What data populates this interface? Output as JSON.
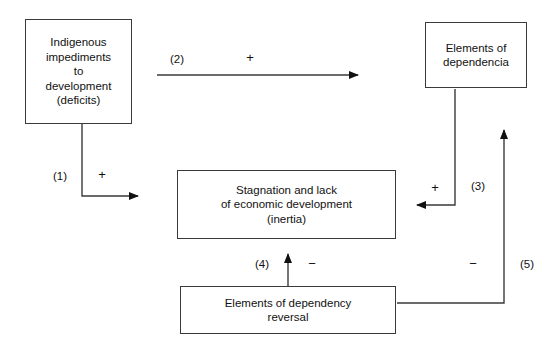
{
  "diagram": {
    "background_color": "#ffffff",
    "stroke_color": "#3a3a3a",
    "text_color": "#111111",
    "nodes": [
      {
        "id": "indigenous-impediments",
        "label": "Indigenous\nimpediments\nto\ndevelopment\n(deficits)"
      },
      {
        "id": "elements-of-dependencia",
        "label": "Elements of\ndependencia"
      },
      {
        "id": "stagnation",
        "label": "Stagnation and lack\nof economic development\n(inertia)"
      },
      {
        "id": "dependency-reversal",
        "label": "Elements of dependency\nreversal"
      }
    ],
    "edges": [
      {
        "id": "edge-1",
        "number": "(1)",
        "sign": "+",
        "from": "indigenous-impediments",
        "to": "stagnation"
      },
      {
        "id": "edge-2",
        "number": "(2)",
        "sign": "+",
        "from": "indigenous-impediments",
        "to": "elements-of-dependencia"
      },
      {
        "id": "edge-3",
        "number": "(3)",
        "sign": "+",
        "from": "elements-of-dependencia",
        "to": "stagnation"
      },
      {
        "id": "edge-4",
        "number": "(4)",
        "sign": "−",
        "from": "dependency-reversal",
        "to": "stagnation"
      },
      {
        "id": "edge-5",
        "number": "(5)",
        "sign": "−",
        "from": "dependency-reversal",
        "to": "elements-of-dependencia"
      }
    ]
  }
}
